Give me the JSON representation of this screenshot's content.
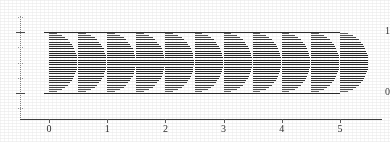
{
  "figure": {
    "kind": "hatched-half-ellipse-density-plot",
    "background_color": "#ffffff",
    "ink_color": "#242424"
  },
  "chart_data": {
    "type": "area",
    "title": "",
    "subtitle": "",
    "xlabel": "",
    "ylabel": "",
    "xlim": [
      -0.25,
      5.75
    ],
    "ylim": [
      -0.35,
      1.3
    ],
    "grid": false,
    "legend": null,
    "x_ticks": [
      0,
      1,
      2,
      3,
      4,
      5
    ],
    "x_tick_labels": [
      "0",
      "1",
      "2",
      "3",
      "4",
      "5"
    ],
    "y_ticks": [
      0,
      1
    ],
    "y_tick_labels": [
      "0",
      "1"
    ],
    "y_minor_ticks": [
      -0.25,
      0.25,
      0.5,
      0.75,
      1.25
    ],
    "reference_lines": [
      {
        "orientation": "horizontal",
        "y": 1,
        "x_start": 0,
        "x_end": 5,
        "style": "solid"
      },
      {
        "orientation": "horizontal",
        "y": 0,
        "x_start": 0,
        "x_end": 5,
        "style": "solid"
      }
    ],
    "series": [
      {
        "name": "half-ellipse density profiles",
        "marker": "horizontal-hatched-half-ellipse",
        "hatch": "horizontal-lines",
        "baseline": "flat-left-edge",
        "y_span": [
          0,
          1
        ],
        "x": [
          0.0,
          0.5,
          1.0,
          1.5,
          2.0,
          2.5,
          3.0,
          3.5,
          4.0,
          4.5,
          5.0
        ],
        "widths": [
          0.4,
          0.4,
          0.4,
          0.4,
          0.4,
          0.4,
          0.4,
          0.4,
          0.4,
          0.4,
          0.4
        ],
        "peak_y": [
          0.5,
          0.5,
          0.5,
          0.5,
          0.5,
          0.5,
          0.5,
          0.5,
          0.5,
          0.5,
          0.5
        ],
        "hatch_line_count": 27,
        "values": [
          1,
          1,
          1,
          1,
          1,
          1,
          1,
          1,
          1,
          1,
          1
        ]
      }
    ],
    "annotations": []
  },
  "axes": {
    "y_labels": [
      {
        "text": "1",
        "value": 1
      },
      {
        "text": "0",
        "value": 0
      }
    ],
    "x_labels": [
      {
        "text": "0",
        "value": 0
      },
      {
        "text": "1",
        "value": 1
      },
      {
        "text": "2",
        "value": 2
      },
      {
        "text": "3",
        "value": 3
      },
      {
        "text": "4",
        "value": 4
      },
      {
        "text": "5",
        "value": 5
      }
    ]
  }
}
